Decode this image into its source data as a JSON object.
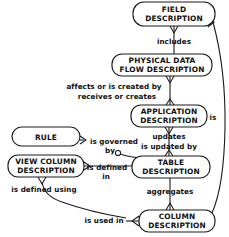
{
  "diagram": {
    "type": "entity-relationship-diagram",
    "notation": "crows-foot",
    "background_color": "#ffffff",
    "line_color": "#1a1a1a",
    "text_color": "#111111",
    "entities": [
      {
        "id": "field",
        "label_lines": [
          "FIELD",
          "DESCRIPTION"
        ]
      },
      {
        "id": "physical",
        "label_lines": [
          "PHYSICAL DATA",
          "FLOW DESCRIPTION"
        ]
      },
      {
        "id": "application",
        "label_lines": [
          "APPLICATION",
          "DESCRIPTION"
        ]
      },
      {
        "id": "rule",
        "label_lines": [
          "RULE"
        ]
      },
      {
        "id": "viewcolumn",
        "label_lines": [
          "VIEW COLUMN",
          "DESCRIPTION"
        ]
      },
      {
        "id": "table",
        "label_lines": [
          "TABLE",
          "DESCRIPTION"
        ]
      },
      {
        "id": "column",
        "label_lines": [
          "COLUMN",
          "DESCRIPTION"
        ]
      }
    ],
    "relationships": [
      {
        "id": "includes",
        "label_lines": [
          "includes"
        ],
        "from": "field",
        "to": "physical"
      },
      {
        "id": "affects",
        "label_lines": [
          "affects or is created by",
          "receives or creates"
        ],
        "from": "physical",
        "to": "application"
      },
      {
        "id": "updates",
        "label_lines": [
          "updates",
          "is updated by"
        ],
        "from": "application",
        "to": "table"
      },
      {
        "id": "governed",
        "label_lines": [
          "is governed",
          "by"
        ],
        "from": "rule",
        "to": "table"
      },
      {
        "id": "defined-in",
        "label_lines": [
          "is defined",
          "in"
        ],
        "from": "viewcolumn",
        "to": "table"
      },
      {
        "id": "aggregates",
        "label_lines": [
          "aggregates"
        ],
        "from": "table",
        "to": "column"
      },
      {
        "id": "defined-using",
        "label_lines": [
          "is defined using"
        ],
        "from": "viewcolumn",
        "to": "column"
      },
      {
        "id": "used-in",
        "label_lines": [
          "is used in"
        ],
        "from": "viewcolumn",
        "to": "column"
      },
      {
        "id": "is",
        "label_lines": [
          "is"
        ],
        "from": "field",
        "to": "column"
      }
    ]
  }
}
